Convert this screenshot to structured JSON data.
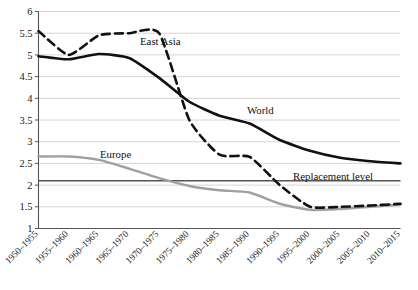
{
  "chart_data": {
    "type": "line",
    "title": "",
    "subtitle": "",
    "xlabel": "",
    "ylabel": "",
    "ylim": [
      1,
      6
    ],
    "ytick_values": [
      1,
      1.5,
      2,
      2.5,
      3,
      3.5,
      4,
      4.5,
      5,
      5.5,
      6
    ],
    "ytick_labels": [
      "1",
      "1.5",
      "2",
      "2.5",
      "3",
      "3.5",
      "4",
      "4.5",
      "5",
      "5.5",
      "6"
    ],
    "grid": true,
    "legend_position": "inline-annotations",
    "categories": [
      "1950–1955",
      "1955–1960",
      "1960–1965",
      "1965–1970",
      "1970–1975",
      "1975–1980",
      "1980–1985",
      "1985–1990",
      "1990–1995",
      "1995–2000",
      "2000–2005",
      "2005–2010",
      "2010–2015"
    ],
    "series": [
      {
        "name": "East Asia",
        "style": "dashed",
        "color": "#111111",
        "values": [
          5.55,
          5.0,
          5.45,
          5.5,
          5.5,
          3.5,
          2.7,
          2.65,
          2.0,
          1.5,
          1.5,
          1.53,
          1.57
        ]
      },
      {
        "name": "World",
        "style": "solid-thick",
        "color": "#111111",
        "values": [
          4.97,
          4.9,
          5.02,
          4.93,
          4.47,
          3.92,
          3.6,
          3.42,
          3.04,
          2.79,
          2.63,
          2.55,
          2.5
        ]
      },
      {
        "name": "Europe",
        "style": "solid-grey",
        "color": "#a0a0a0",
        "values": [
          2.66,
          2.66,
          2.58,
          2.38,
          2.16,
          1.98,
          1.88,
          1.83,
          1.57,
          1.43,
          1.45,
          1.5,
          1.55
        ]
      }
    ],
    "reference_lines": [
      {
        "name": "Replacement level",
        "value": 2.1,
        "label": "Replacement level",
        "color": "#555555"
      }
    ],
    "annotations": [
      {
        "text": "East Asia",
        "series": "East Asia",
        "x_px": 140,
        "y_px": 45
      },
      {
        "text": "World",
        "series": "World",
        "x_px": 247,
        "y_px": 114
      },
      {
        "text": "Europe",
        "series": "Europe",
        "x_px": 100,
        "y_px": 158
      },
      {
        "text": "Replacement level",
        "series": "Replacement level",
        "x_px": 293,
        "y_px": 180
      }
    ]
  }
}
